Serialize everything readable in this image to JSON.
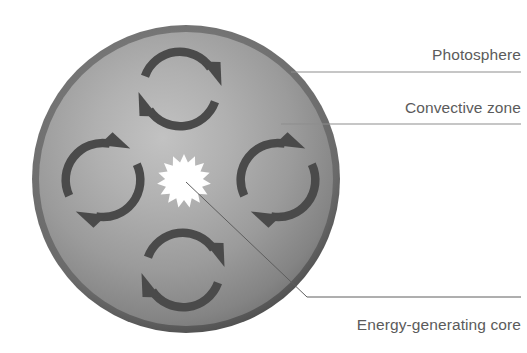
{
  "diagram": {
    "background_color": "#ffffff",
    "sphere": {
      "name": "sun-sphere",
      "center_x": 186,
      "center_y": 179,
      "radius": 154,
      "rim_color": "#4f4f4f",
      "body_light_color": "#b4b4b4",
      "body_mid_color": "#9d9d9d",
      "body_dark_color": "#6e6e6e"
    },
    "core": {
      "name": "energy-generating-core",
      "center_x": 184,
      "center_y": 181,
      "outer_radius": 27,
      "inner_radius": 19,
      "points": 15,
      "color": "#ffffff"
    },
    "convection_cells": [
      {
        "name": "convection-arrow-top",
        "cx": 180,
        "cy": 89,
        "rotation": 0
      },
      {
        "name": "convection-arrow-left",
        "cx": 103,
        "cy": 180,
        "rotation": -45
      },
      {
        "name": "convection-arrow-right",
        "cx": 278,
        "cy": 180,
        "rotation": -45
      },
      {
        "name": "convection-arrow-bottom",
        "cx": 183,
        "cy": 270,
        "rotation": 0
      }
    ],
    "arrow_color": "#4a4a4a",
    "labels": [
      {
        "id": "photosphere",
        "text": "Photosphere",
        "text_x": 521,
        "text_y": 60,
        "anchor": "end",
        "leader": "M 291 72 L 369 72 L 521 72",
        "leader_name": "photosphere-leader-line"
      },
      {
        "id": "convective-zone",
        "text": "Convective zone",
        "text_x": 521,
        "text_y": 113,
        "anchor": "end",
        "leader": "M 281 124 L 521 124",
        "leader_name": "convective-zone-leader-line"
      },
      {
        "id": "energy-generating-core",
        "text": "Energy-generating core",
        "text_x": 521,
        "text_y": 330,
        "anchor": "end",
        "leader": "M 186 182 L 307 297 L 521 297",
        "leader_name": "core-leader-line"
      }
    ],
    "label_text_color": "#5b5b5b",
    "leader_line_color": "#8d8d8d"
  }
}
